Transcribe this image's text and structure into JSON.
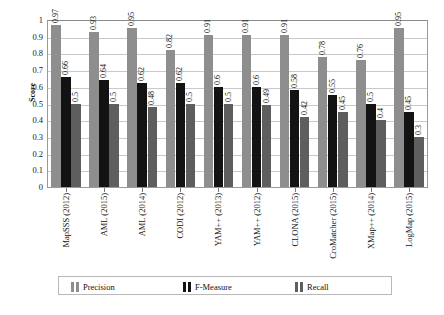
{
  "chart_data": {
    "type": "bar",
    "title": "",
    "xlabel": "",
    "ylabel": "Score",
    "ylim": [
      0,
      1
    ],
    "ytick_labels": [
      "1",
      "0.9",
      "0.8",
      "0.7",
      "0.6",
      "0.5",
      "0.4",
      "0.3",
      "0.2",
      "0.1",
      "0"
    ],
    "ytick_values": [
      1,
      0.9,
      0.8,
      0.7,
      0.6,
      0.5,
      0.4,
      0.3,
      0.2,
      0.1,
      0
    ],
    "grid": true,
    "legend_position": "bottom",
    "categories": [
      "MapSSS (2012)",
      "AML (2015)",
      "AML (2014)",
      "CODI (2012)",
      "YAM++ (2013)",
      "YAM++ (2012)",
      "CLONA (2015)",
      "CroMatcher (2015)",
      "XMap++ (2014)",
      "LogMap (2015)"
    ],
    "series": [
      {
        "name": "Precision",
        "color": "#8e8e8e",
        "values": [
          0.97,
          0.93,
          0.95,
          0.82,
          0.91,
          0.91,
          0.91,
          0.78,
          0.76,
          0.95
        ],
        "labels": [
          "0.97",
          "0.93",
          "0.95",
          "0.82",
          "0.91",
          "0.91",
          "0.91",
          "0.78",
          "0.76",
          "0.95"
        ]
      },
      {
        "name": "F-Measure",
        "color": "#131313",
        "values": [
          0.66,
          0.64,
          0.62,
          0.62,
          0.6,
          0.6,
          0.58,
          0.55,
          0.5,
          0.45
        ],
        "labels": [
          "0.66",
          "0.64",
          "0.62",
          "0.62",
          "0.6",
          "0.6",
          "0.58",
          "0.55",
          "0.5",
          "0.45"
        ]
      },
      {
        "name": "Recall",
        "color": "#5e5e5e",
        "values": [
          0.5,
          0.5,
          0.48,
          0.5,
          0.5,
          0.49,
          0.42,
          0.45,
          0.4,
          0.3
        ],
        "labels": [
          "0.5",
          "0.5",
          "0.48",
          "0.5",
          "0.5",
          "0.49",
          "0.42",
          "0.45",
          "0.4",
          "0.3"
        ]
      }
    ]
  }
}
